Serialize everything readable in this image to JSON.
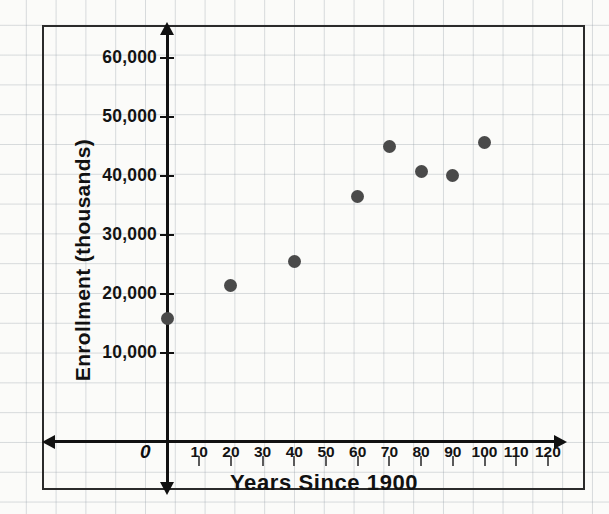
{
  "chart_data": {
    "type": "scatter",
    "title": "",
    "xlabel": "Years Since 1900",
    "ylabel": "Enrollment (thousands)",
    "origin_label": "0",
    "xlim": [
      0,
      120
    ],
    "ylim": [
      0,
      60000
    ],
    "grid": true,
    "legend": "none",
    "x_ticks": [
      10,
      20,
      30,
      40,
      50,
      60,
      70,
      80,
      90,
      100,
      110,
      120
    ],
    "x_tick_labels": [
      "10",
      "20",
      "30",
      "40",
      "50",
      "60",
      "70",
      "80",
      "90",
      "100",
      "110",
      "120"
    ],
    "y_ticks": [
      10000,
      20000,
      30000,
      40000,
      50000,
      60000
    ],
    "y_tick_labels": [
      "10,000",
      "20,000",
      "30,000",
      "40,000",
      "50,000",
      "60,000"
    ],
    "points": [
      {
        "x": 0,
        "y": 15800
      },
      {
        "x": 20,
        "y": 21500
      },
      {
        "x": 40,
        "y": 25500
      },
      {
        "x": 60,
        "y": 36500
      },
      {
        "x": 70,
        "y": 45000
      },
      {
        "x": 80,
        "y": 40700
      },
      {
        "x": 90,
        "y": 40100
      },
      {
        "x": 100,
        "y": 45700
      }
    ],
    "point_color": "#4a4a4a",
    "axis_color": "#111111",
    "grid_color": "#8c96a0",
    "background": "#fbfbf9"
  }
}
